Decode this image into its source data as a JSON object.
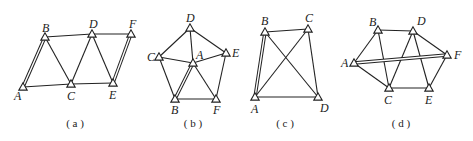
{
  "figures": [
    {
      "id": "a",
      "caption": "( a )",
      "caption_pos": [
        75,
        127
      ],
      "nodes": [
        {
          "name": "A",
          "x": 23,
          "y": 87,
          "lx": -9,
          "ly": 13
        },
        {
          "name": "B",
          "x": 45,
          "y": 37,
          "lx": -3,
          "ly": -5
        },
        {
          "name": "C",
          "x": 71,
          "y": 84,
          "lx": -4,
          "ly": 16
        },
        {
          "name": "D",
          "x": 92,
          "y": 34,
          "lx": -3,
          "ly": -6
        },
        {
          "name": "E",
          "x": 113,
          "y": 83,
          "lx": -4,
          "ly": 16
        },
        {
          "name": "F",
          "x": 131,
          "y": 34,
          "lx": -2,
          "ly": -6
        }
      ],
      "edges": [
        [
          "B",
          "D"
        ],
        [
          "D",
          "F"
        ],
        [
          "A",
          "C"
        ],
        [
          "C",
          "E"
        ],
        [
          "B",
          "C"
        ],
        [
          "C",
          "D"
        ],
        [
          "D",
          "E"
        ]
      ],
      "double_edges": [
        [
          "A",
          "B"
        ],
        [
          "E",
          "F"
        ]
      ]
    },
    {
      "id": "b",
      "caption": "( b )",
      "caption_pos": [
        193,
        127
      ],
      "nodes": [
        {
          "name": "D",
          "x": 190,
          "y": 28,
          "lx": -4,
          "ly": -6
        },
        {
          "name": "C",
          "x": 159,
          "y": 57,
          "lx": -12,
          "ly": 4
        },
        {
          "name": "A",
          "x": 193,
          "y": 63,
          "lx": 3,
          "ly": -4
        },
        {
          "name": "E",
          "x": 226,
          "y": 53,
          "lx": 6,
          "ly": 4
        },
        {
          "name": "B",
          "x": 175,
          "y": 99,
          "lx": -4,
          "ly": 15
        },
        {
          "name": "F",
          "x": 216,
          "y": 99,
          "lx": -3,
          "ly": 15
        }
      ],
      "edges": [
        [
          "D",
          "C"
        ],
        [
          "D",
          "A"
        ],
        [
          "D",
          "E"
        ],
        [
          "C",
          "A"
        ],
        [
          "A",
          "E"
        ],
        [
          "C",
          "B"
        ],
        [
          "A",
          "F"
        ],
        [
          "B",
          "F"
        ],
        [
          "E",
          "F"
        ]
      ],
      "double_edges": [
        [
          "A",
          "B"
        ]
      ]
    },
    {
      "id": "c",
      "caption": "( c )",
      "caption_pos": [
        285,
        127
      ],
      "nodes": [
        {
          "name": "B",
          "x": 265,
          "y": 32,
          "lx": -4,
          "ly": -7
        },
        {
          "name": "C",
          "x": 308,
          "y": 29,
          "lx": -3,
          "ly": -7
        },
        {
          "name": "A",
          "x": 255,
          "y": 97,
          "lx": -4,
          "ly": 16
        },
        {
          "name": "D",
          "x": 318,
          "y": 97,
          "lx": 2,
          "ly": 15
        }
      ],
      "edges": [
        [
          "B",
          "C"
        ],
        [
          "A",
          "D"
        ],
        [
          "C",
          "D"
        ],
        [
          "A",
          "C"
        ],
        [
          "B",
          "D"
        ]
      ],
      "double_edges": [
        [
          "A",
          "B"
        ]
      ]
    },
    {
      "id": "d",
      "caption": "( d )",
      "caption_pos": [
        401,
        127
      ],
      "nodes": [
        {
          "name": "B",
          "x": 378,
          "y": 30,
          "lx": -9,
          "ly": -4
        },
        {
          "name": "D",
          "x": 413,
          "y": 31,
          "lx": 4,
          "ly": -6
        },
        {
          "name": "A",
          "x": 354,
          "y": 63,
          "lx": -13,
          "ly": 4
        },
        {
          "name": "F",
          "x": 447,
          "y": 55,
          "lx": 7,
          "ly": 4
        },
        {
          "name": "C",
          "x": 389,
          "y": 88,
          "lx": -5,
          "ly": 16
        },
        {
          "name": "E",
          "x": 429,
          "y": 88,
          "lx": -4,
          "ly": 16
        }
      ],
      "edges": [
        [
          "A",
          "B"
        ],
        [
          "B",
          "D"
        ],
        [
          "D",
          "F"
        ],
        [
          "A",
          "C"
        ],
        [
          "B",
          "C"
        ],
        [
          "C",
          "D"
        ],
        [
          "D",
          "E"
        ],
        [
          "C",
          "E"
        ],
        [
          "E",
          "F"
        ]
      ],
      "double_edges": [
        [
          "A",
          "F"
        ]
      ]
    }
  ]
}
